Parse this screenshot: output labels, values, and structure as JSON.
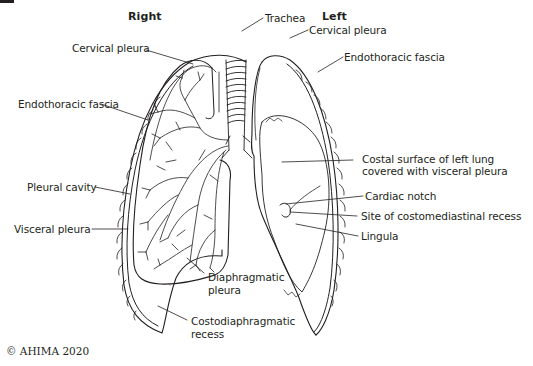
{
  "headings": {
    "right": "Right",
    "left": "Left"
  },
  "labels": {
    "trachea": "Trachea",
    "cervical_pleura_right": "Cervical pleura",
    "endothoracic_fascia_right": "Endothoracic fascia",
    "pleural_cavity": "Pleural cavity",
    "visceral_pleura": "Visceral pleura",
    "diaphragmatic_pleura_1": "Diaphragmatic",
    "diaphragmatic_pleura_2": "pleura",
    "costodiaphragmatic_recess_1": "Costodiaphragmatic",
    "costodiaphragmatic_recess_2": "recess",
    "cervical_pleura_left": "Cervical pleura",
    "endothoracic_fascia_left": "Endothoracic fascia",
    "costal_surface_1": "Costal surface of left lung",
    "costal_surface_2": "covered with visceral pleura",
    "cardiac_notch": "Cardiac notch",
    "costomediastinal_recess": "Site of costomediastinal recess",
    "lingula": "Lingula"
  },
  "footer": {
    "copyright": "© AHIMA 2020"
  },
  "colors": {
    "ink": "#231f20",
    "background": "#ffffff"
  }
}
